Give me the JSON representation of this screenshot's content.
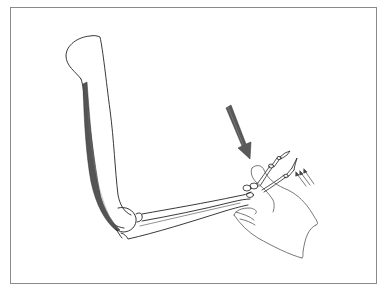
{
  "figure": {
    "type": "anatomical-line-drawing",
    "frame": {
      "border_color": "#8a8a8a",
      "background": "#ffffff"
    },
    "elements": {
      "humerus": {
        "stroke": "#222222"
      },
      "muscle": {
        "fill": "#555555",
        "label": ""
      },
      "forearm_bones": {
        "stroke": "#222222"
      },
      "hand_bones": {
        "stroke": "#222222"
      },
      "examiner_hand": {
        "stroke": "#555555"
      },
      "force_arrow": {
        "fill": "#5a5a5a",
        "direction": "down-right"
      },
      "motion_arrows": {
        "count": 3,
        "stroke": "#444444",
        "direction": "up-left"
      }
    },
    "colors": {
      "line": "#222222",
      "muscle": "#555555",
      "arrow": "#5a5a5a",
      "frame": "#8a8a8a"
    }
  }
}
